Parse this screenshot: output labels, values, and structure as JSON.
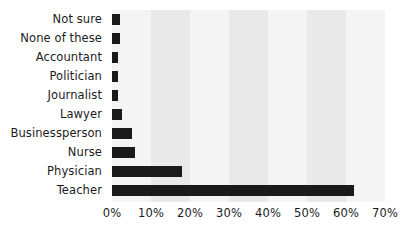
{
  "chart_data": {
    "type": "bar",
    "orientation": "horizontal",
    "title": "",
    "subtitle": "",
    "xlabel": "",
    "ylabel": "",
    "categories": [
      "Not sure",
      "None of these",
      "Accountant",
      "Politician",
      "Journalist",
      "Lawyer",
      "Businessperson",
      "Nurse",
      "Physician",
      "Teacher"
    ],
    "values": [
      2,
      2,
      1.5,
      1.5,
      1.5,
      2.5,
      5,
      6,
      18,
      62
    ],
    "value_suffix": "%",
    "xlim": [
      0,
      70
    ],
    "tick_labels": [
      "0%",
      "10%",
      "20%",
      "30%",
      "40%",
      "50%",
      "60%",
      "70%"
    ],
    "tick_values": [
      0,
      10,
      20,
      30,
      40,
      50,
      60,
      70
    ],
    "grid": false,
    "alternating_bands": true,
    "legend": false,
    "legend_position": "none",
    "bar_color": "#1a1a1a",
    "band_color_dark": "#e9e9e9",
    "band_color_light": "#f4f4f4",
    "background_color": "#ffffff",
    "text_color": "#1b1b1b"
  }
}
